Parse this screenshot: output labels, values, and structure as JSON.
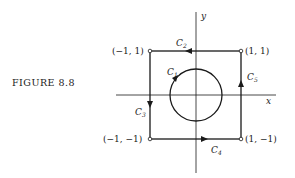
{
  "figure": {
    "caption": "FIGURE 8.8",
    "axes": {
      "x_label": "x",
      "y_label": "y"
    },
    "corners": {
      "top_left": "(−1, 1)",
      "top_right": "(1, 1)",
      "bottom_left": "(−1, −1)",
      "bottom_right": "(1, −1)"
    },
    "curves": [
      {
        "name": "C",
        "sub": "1",
        "description": "circle centered at origin, counterclockwise"
      },
      {
        "name": "C",
        "sub": "2",
        "description": "top edge, right to left"
      },
      {
        "name": "C",
        "sub": "3",
        "description": "left edge, top to bottom"
      },
      {
        "name": "C",
        "sub": "4",
        "description": "bottom edge, left to right"
      },
      {
        "name": "C",
        "sub": "5",
        "description": "right edge, bottom to top"
      }
    ]
  }
}
